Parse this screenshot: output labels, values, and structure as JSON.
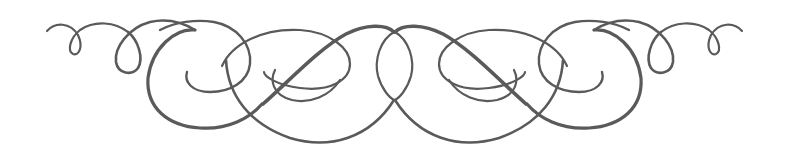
{
  "image": {
    "description": "Symmetric decorative calligraphic flourish ornament",
    "colors": {
      "background": "#ffffff",
      "ink": "#5a5a5a"
    }
  }
}
